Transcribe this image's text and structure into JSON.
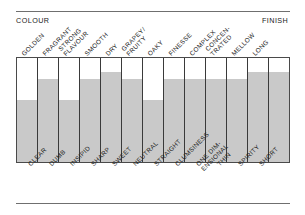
{
  "header": {
    "left_label": "COLOUR",
    "right_label": "FINISH"
  },
  "chart_data": {
    "type": "bar",
    "title": "",
    "subtitle": "",
    "xlabel": "",
    "ylabel": "",
    "orientation": "vertical",
    "grid": false,
    "legend": false,
    "axis_left_label": "COLOUR",
    "axis_right_label": "FINISH",
    "ylim": [
      0,
      100
    ],
    "fill_color": "#c9c9c9",
    "frame_color": "#4a4a4a",
    "divider_color": "#3a3a3a",
    "rule_color": "#6f6f6f",
    "top_categories": [
      "GOLDEN",
      "FRAGRANT",
      "STRONG FLAVOUR",
      "SMOOTH",
      "DRY",
      "GRAPEY/ FRUITY",
      "OAKY",
      "FINESSE",
      "COMPLEX",
      "CONCEN- TRATED",
      "MELLOW",
      "LONG"
    ],
    "bottom_categories": [
      "CLEAR",
      "DUMB",
      "INSIPID",
      "SHARP",
      "SWEET",
      "NEUTRAL",
      "STRAIGHT",
      "CLUMSINESS",
      "ONE DIM- ENSIONAL",
      "THIN",
      "SPIRITY",
      "SHORT"
    ],
    "categories": [
      "CLEAR / GOLDEN",
      "DUMB / FRAGRANT",
      "INSIPID / STRONG FLAVOUR",
      "SHARP / SMOOTH",
      "SWEET / DRY",
      "NEUTRAL / GRAPEY-FRUITY",
      "STRAIGHT / OAKY",
      "CLUMSINESS / FINESSE",
      "ONE DIMENSIONAL / COMPLEX",
      "THIN / CONCENTRATED",
      "SPIRITY / MELLOW",
      "SHORT / LONG",
      "SHORT / LONG"
    ],
    "values": [
      60,
      80,
      60,
      80,
      87,
      80,
      60,
      80,
      80,
      80,
      80,
      87,
      87
    ],
    "bars": [
      {
        "top_label": "GOLDEN",
        "top_line2": "",
        "bottom_label": "CLEAR",
        "bottom_line2": "",
        "value": 60
      },
      {
        "top_label": "FRAGRANT",
        "top_line2": "",
        "bottom_label": "DUMB",
        "bottom_line2": "",
        "value": 80
      },
      {
        "top_label": "STRONG",
        "top_line2": "FLAVOUR",
        "bottom_label": "INSIPID",
        "bottom_line2": "",
        "value": 60
      },
      {
        "top_label": "SMOOTH",
        "top_line2": "",
        "bottom_label": "SHARP",
        "bottom_line2": "",
        "value": 80
      },
      {
        "top_label": "DRY",
        "top_line2": "",
        "bottom_label": "SWEET",
        "bottom_line2": "",
        "value": 87
      },
      {
        "top_label": "GRAPEY/",
        "top_line2": "FRUITY",
        "bottom_label": "NEUTRAL",
        "bottom_line2": "",
        "value": 80
      },
      {
        "top_label": "OAKY",
        "top_line2": "",
        "bottom_label": "STRAIGHT",
        "bottom_line2": "",
        "value": 60
      },
      {
        "top_label": "FINESSE",
        "top_line2": "",
        "bottom_label": "CLUMSINESS",
        "bottom_line2": "",
        "value": 80
      },
      {
        "top_label": "COMPLEX",
        "top_line2": "",
        "bottom_label": "ONE DIM-",
        "bottom_line2": "ENSIONAL",
        "value": 80
      },
      {
        "top_label": "CONCEN-",
        "top_line2": "TRATED",
        "bottom_label": "THIN",
        "bottom_line2": "",
        "value": 80
      },
      {
        "top_label": "MELLOW",
        "top_line2": "",
        "bottom_label": "SPIRITY",
        "bottom_line2": "",
        "value": 80
      },
      {
        "top_label": "LONG",
        "top_line2": "",
        "bottom_label": "SHORT",
        "bottom_line2": "",
        "value": 87
      },
      {
        "top_label": "",
        "top_line2": "",
        "bottom_label": "",
        "bottom_line2": "",
        "value": 87
      }
    ]
  }
}
